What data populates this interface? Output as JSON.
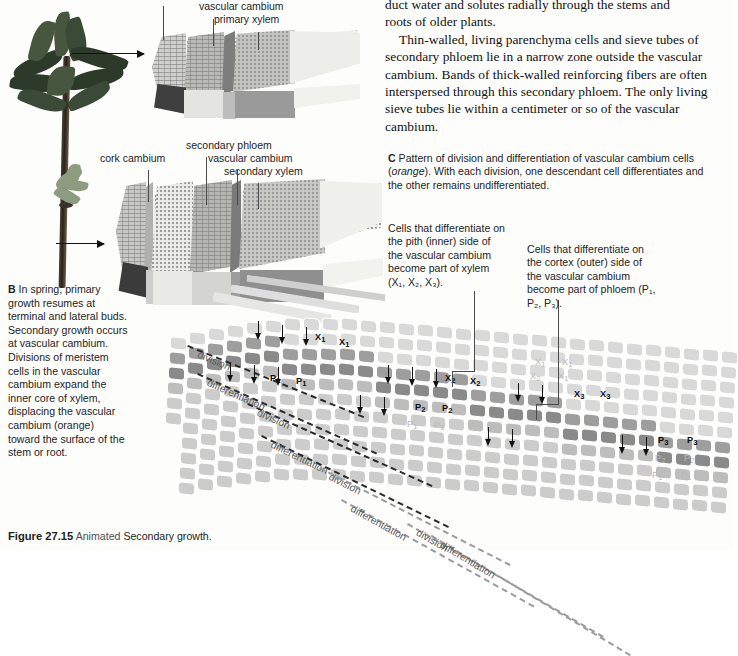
{
  "figure": {
    "number": "Figure 27.15",
    "animated": "Animated",
    "title": "Secondary growth."
  },
  "body_text": {
    "line_top_clipped": "duct water and solutes radially through the stems and",
    "line_2": "roots of older plants.",
    "paragraph": "Thin-walled, living parenchyma cells and sieve tubes of secondary phloem lie in a narrow zone outside the vascular cambium. Bands of thick-walled reinforcing fibers are often interspersed through this secondary phloem. The only living sieve tubes lie within a centimeter or so of the vascular cambium."
  },
  "panelA": {
    "labels": [
      {
        "text": "vascular cambium",
        "x": 199,
        "y": 6
      },
      {
        "text": "primary xylem",
        "x": 214,
        "y": 19
      }
    ]
  },
  "panelB": {
    "letter": "B",
    "caption": "In spring, primary growth resumes at terminal and lateral buds. Secondary growth occurs at vascular cambium. Divisions of meristem cells in the vascular cambium expand the inner core of xylem, displacing the vascular cambium (orange) toward the surface of the stem or root.",
    "caption_italic_word": "orange",
    "labels": [
      {
        "text": "secondary phloem",
        "x": 186,
        "y": 145
      },
      {
        "text": "cork cambium",
        "x": 123,
        "y": 158
      },
      {
        "text": "vascular cambium",
        "x": 208,
        "y": 158
      },
      {
        "text": "secondary xylem",
        "x": 224,
        "y": 171
      }
    ]
  },
  "panelC": {
    "letter": "C",
    "caption_part1": "Pattern of division and differentiation of vascular cambium cells (",
    "caption_italic": "orange",
    "caption_part2": "). With each division, one descendant cell differentiates and the other remains undifferentiated.",
    "xylem_note": "Cells that differentiate on the pith (inner) side of the vascular cambium become part of xylem (X₁, X₂, X₃).",
    "phloem_note": "Cells that differentiate on the cortex (outer) side of the vascular cambium become part of phloem (P₁, P₂, P₃).",
    "cell_labels": [
      {
        "text": "X",
        "sub": "1",
        "x": 145,
        "y": 47,
        "ghost": false
      },
      {
        "text": "X",
        "sub": "1",
        "x": 169,
        "y": 52,
        "ghost": false
      },
      {
        "text": "P",
        "sub": "1",
        "x": 100,
        "y": 88,
        "ghost": false
      },
      {
        "text": "P",
        "sub": "1",
        "x": 126,
        "y": 91,
        "ghost": false
      },
      {
        "text": "X",
        "sub": "2",
        "x": 275,
        "y": 88,
        "ghost": false
      },
      {
        "text": "X",
        "sub": "2",
        "x": 300,
        "y": 91,
        "ghost": false
      },
      {
        "text": "X",
        "sub": "1",
        "x": 365,
        "y": 72,
        "ghost": true
      },
      {
        "text": "X",
        "sub": "1",
        "x": 392,
        "y": 72,
        "ghost": true
      },
      {
        "text": "X",
        "sub": "2",
        "x": 360,
        "y": 86,
        "ghost": true
      },
      {
        "text": "X",
        "sub": "1",
        "x": 388,
        "y": 86,
        "ghost": true
      },
      {
        "text": "P",
        "sub": "2",
        "x": 245,
        "y": 117,
        "ghost": false
      },
      {
        "text": "P",
        "sub": "2",
        "x": 272,
        "y": 118,
        "ghost": false
      },
      {
        "text": "P",
        "sub": "1",
        "x": 237,
        "y": 134,
        "ghost": true
      },
      {
        "text": "P",
        "sub": "1",
        "x": 264,
        "y": 135,
        "ghost": true
      },
      {
        "text": "X",
        "sub": "3",
        "x": 404,
        "y": 104,
        "ghost": false
      },
      {
        "text": "X",
        "sub": "3",
        "x": 430,
        "y": 104,
        "ghost": false
      },
      {
        "text": "P",
        "sub": "3",
        "x": 488,
        "y": 150,
        "ghost": false
      },
      {
        "text": "P",
        "sub": "3",
        "x": 517,
        "y": 150,
        "ghost": false
      },
      {
        "text": "P",
        "sub": "2",
        "x": 485,
        "y": 168,
        "ghost": true
      },
      {
        "text": "P",
        "sub": "2",
        "x": 514,
        "y": 168,
        "ghost": true
      },
      {
        "text": "P",
        "sub": "1",
        "x": 482,
        "y": 185,
        "ghost": true
      },
      {
        "text": "P",
        "sub": "1",
        "x": 511,
        "y": 185,
        "ghost": true
      }
    ],
    "process_labels": [
      {
        "text": "division",
        "x": 18,
        "y": 60,
        "rot": 22
      },
      {
        "text": "differentiation",
        "x": 28,
        "y": 88,
        "rot": 24
      },
      {
        "text": "division",
        "x": 78,
        "y": 118,
        "rot": 24
      },
      {
        "text": "differentiation",
        "x": 92,
        "y": 150,
        "rot": 26
      },
      {
        "text": "division",
        "x": 150,
        "y": 182,
        "rot": 27
      },
      {
        "text": "differentiation",
        "x": 172,
        "y": 214,
        "rot": 29
      },
      {
        "text": "division",
        "x": 238,
        "y": 238,
        "rot": 30
      },
      {
        "text": "differentiation",
        "x": 262,
        "y": 250,
        "rot": 31
      }
    ]
  },
  "colors": {
    "cambium_dark": "#8a8a8a",
    "cambium_mid": "#a8a8a8",
    "xylem_light": "#d6d6d6",
    "phloem_light": "#cfcfcf",
    "page_bg": "#fdfdfc",
    "ink": "#1a1a1a"
  }
}
